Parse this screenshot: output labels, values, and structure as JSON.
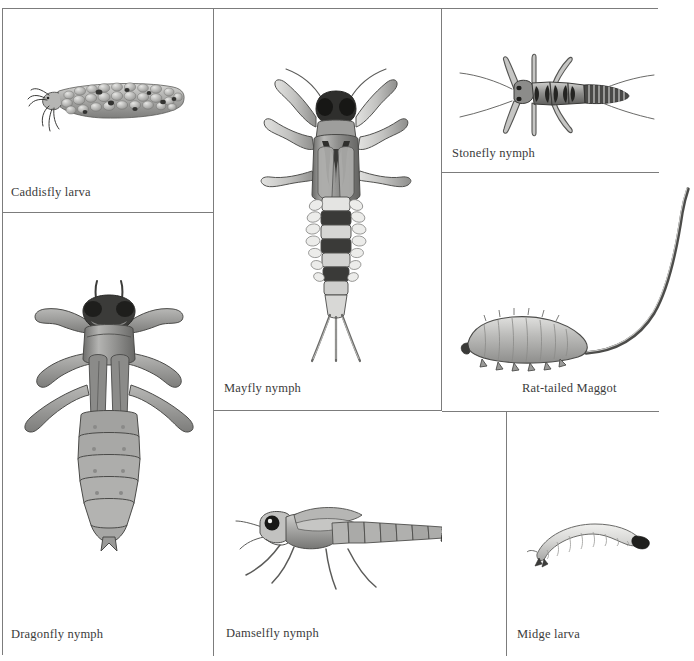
{
  "plate": {
    "title": "Aquatic Macroinvertebrate Identification Plate",
    "background_color": "#ffffff",
    "border_color": "#7c7c7c",
    "ink_color": "#3b3b3b",
    "panel_count": 7
  },
  "panels": [
    {
      "id": "caddisfly",
      "label": "Caddisfly larva",
      "icon": "caddisfly-larva-illustration",
      "row": "top",
      "column": "left"
    },
    {
      "id": "mayfly",
      "label": "Mayfly nymph",
      "icon": "mayfly-nymph-illustration",
      "row": "top",
      "column": "center"
    },
    {
      "id": "stonefly",
      "label": "Stonefly nymph",
      "icon": "stonefly-nymph-illustration",
      "row": "top",
      "column": "right"
    },
    {
      "id": "rattailed",
      "label": "Rat-tailed Maggot",
      "icon": "rat-tailed-maggot-illustration",
      "row": "middle",
      "column": "right"
    },
    {
      "id": "dragonfly",
      "label": "Dragonfly nymph",
      "icon": "dragonfly-nymph-illustration",
      "row": "bottom",
      "column": "left"
    },
    {
      "id": "damselfly",
      "label": "Damselfly nymph",
      "icon": "damselfly-nymph-illustration",
      "row": "bottom",
      "column": "center"
    },
    {
      "id": "midge",
      "label": "Midge larva",
      "icon": "midge-larva-illustration",
      "row": "bottom",
      "column": "right"
    }
  ]
}
